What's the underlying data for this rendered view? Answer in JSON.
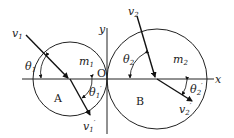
{
  "diagram": {
    "type": "collision-diagram",
    "axes": {
      "x_label": "x",
      "y_label": "y",
      "origin_label": "O"
    },
    "bodies": [
      {
        "id": "A",
        "label": "A",
        "mass_label": "m",
        "mass_sub": "1",
        "center": [
          70,
          79
        ],
        "radius": 37
      },
      {
        "id": "B",
        "label": "B",
        "mass_label": "m",
        "mass_sub": "2",
        "center": [
          157,
          79
        ],
        "radius": 50
      }
    ],
    "velocities": {
      "v1": {
        "label": "v",
        "sub": "1",
        "prime": ""
      },
      "v1p": {
        "label": "v",
        "sub": "1",
        "prime": "′"
      },
      "v2": {
        "label": "v",
        "sub": "2",
        "prime": ""
      },
      "v2p": {
        "label": "v",
        "sub": "2",
        "prime": "′"
      }
    },
    "angles": {
      "theta1": {
        "label": "θ",
        "sub": "1",
        "prime": ""
      },
      "theta1p": {
        "label": "θ",
        "sub": "1",
        "prime": "′"
      },
      "theta2": {
        "label": "θ",
        "sub": "2",
        "prime": ""
      },
      "theta2p": {
        "label": "θ",
        "sub": "2",
        "prime": "′"
      }
    }
  }
}
